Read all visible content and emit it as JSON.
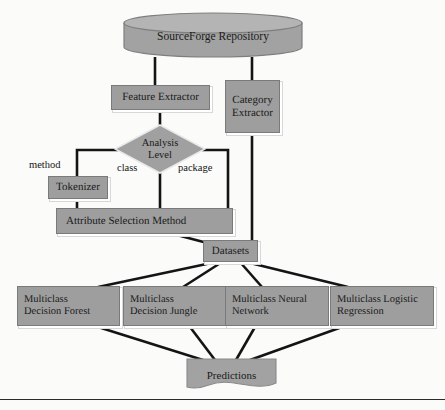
{
  "diagram": {
    "colors": {
      "node_fill": "#9e9e9e",
      "node_stroke": "#7a7a7a",
      "edge": "#141414",
      "text": "#1a1a1a",
      "background": "#fbfbfa",
      "shadow": "#d8d8d8"
    },
    "nodes": {
      "repository": {
        "label": "SourceForge Repository",
        "shape": "cylinder"
      },
      "feature_extractor": {
        "label": "Feature Extractor",
        "shape": "rectangle"
      },
      "category_extractor": {
        "label": "Category\nExtractor",
        "line1": "Category",
        "line2": "Extractor",
        "shape": "rectangle"
      },
      "analysis_level": {
        "label": "Analysis Level",
        "line1": "Analysis",
        "line2": "Level",
        "shape": "diamond"
      },
      "tokenizer": {
        "label": "Tokenizer",
        "shape": "rectangle"
      },
      "attribute_selection": {
        "label": "Attribute Selection Method",
        "shape": "rectangle"
      },
      "datasets": {
        "label": "Datasets",
        "shape": "rectangle"
      },
      "decision_forest": {
        "label": "Multiclass Decision Forest",
        "line1": "Multiclass",
        "line2": "Decision Forest",
        "shape": "rectangle"
      },
      "decision_jungle": {
        "label": "Multiclass Decision Jungle",
        "line1": "Multiclass",
        "line2": "Decision Jungle",
        "shape": "rectangle"
      },
      "neural_network": {
        "label": "Multiclass Neural Network",
        "line1": "Multiclass Neural",
        "line2": "Network",
        "shape": "rectangle"
      },
      "logistic_regression": {
        "label": "Multiclass Logistic Regression",
        "line1": "Multiclass Logistic",
        "line2": "Regression",
        "shape": "rectangle"
      },
      "predictions": {
        "label": "Predictions",
        "shape": "document"
      }
    },
    "edge_labels": {
      "method": "method",
      "class": "class",
      "package": "package"
    }
  }
}
